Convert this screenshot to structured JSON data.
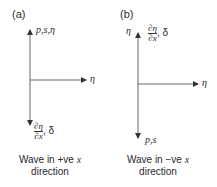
{
  "panels": [
    {
      "id": "a",
      "label": "(a)",
      "up_label": "p,s,η",
      "right_label": "η",
      "down_label_frac_num": "∂η",
      "down_label_frac_den": "∂x",
      "down_label_suffix": ", δ",
      "caption_line1_prefix": "Wave in +ve ",
      "caption_line1_var": "x",
      "caption_line2": "direction"
    },
    {
      "id": "b",
      "label": "(b)",
      "up_left_label": "η",
      "up_label_frac_num": "∂η",
      "up_label_frac_den": "∂x",
      "up_label_suffix": ", δ",
      "right_label": "η",
      "down_label": "p,s",
      "caption_line1_prefix": "Wave in −ve ",
      "caption_line1_var": "x",
      "caption_line2": "direction"
    }
  ],
  "colors": {
    "axis": "#555555",
    "text": "#2a2a2a"
  }
}
